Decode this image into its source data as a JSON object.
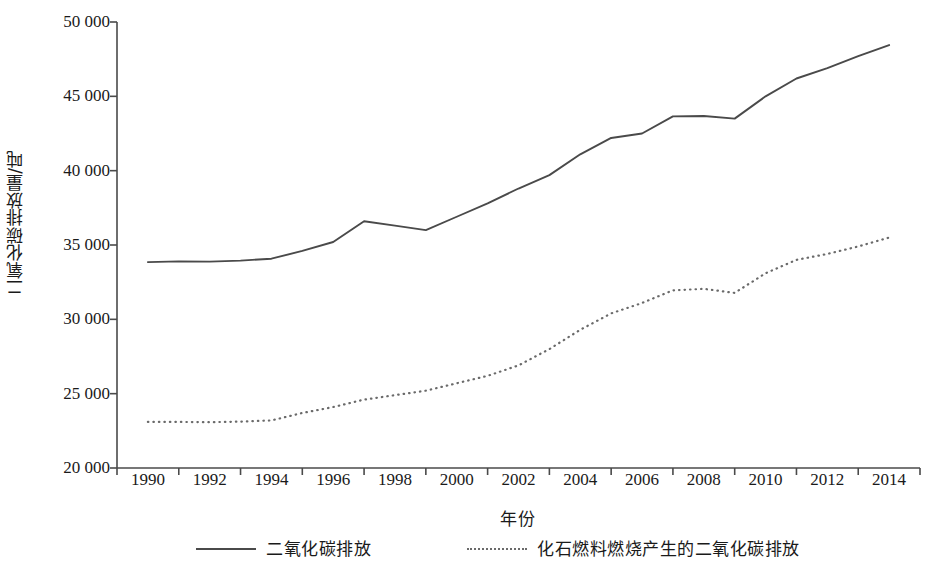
{
  "chart_data": {
    "type": "line",
    "title": "",
    "xlabel": "年份",
    "ylabel": "二氧化碳排放量/吨",
    "xlim": [
      1989,
      2015
    ],
    "ylim": [
      20000,
      50000
    ],
    "ytick_values": [
      50000,
      45000,
      40000,
      35000,
      30000,
      25000,
      20000
    ],
    "ytick_labels": [
      "50 000",
      "45 000",
      "40 000",
      "35 000",
      "30 000",
      "25 000",
      "20 000"
    ],
    "xtick_values": [
      1990,
      1992,
      1994,
      1996,
      1998,
      2000,
      2002,
      2004,
      2006,
      2008,
      2010,
      2012,
      2014
    ],
    "xtick_labels": [
      "1990",
      "1992",
      "1994",
      "1996",
      "1998",
      "2000",
      "2002",
      "2004",
      "2006",
      "2008",
      "2010",
      "2012",
      "2014"
    ],
    "grid": false,
    "legend_position": "bottom",
    "x": [
      1990,
      1991,
      1992,
      1993,
      1994,
      1995,
      1996,
      1997,
      1998,
      1999,
      2000,
      2001,
      2002,
      2003,
      2004,
      2005,
      2006,
      2007,
      2008,
      2009,
      2010,
      2011,
      2012,
      2013,
      2014
    ],
    "series": [
      {
        "name": "二氧化碳排放",
        "style": "solid",
        "color": "#4a4a4a",
        "values": [
          33850,
          33900,
          33880,
          33950,
          34080,
          34600,
          35200,
          36600,
          36300,
          36000,
          36900,
          37800,
          38800,
          39700,
          41100,
          42200,
          42500,
          43650,
          43680,
          43500,
          45000,
          46200,
          46900,
          47700,
          48450
        ]
      },
      {
        "name": "化石燃料燃烧产生的二氧化碳排放",
        "style": "dotted",
        "color": "#6a6a6a",
        "values": [
          23100,
          23100,
          23080,
          23120,
          23200,
          23700,
          24100,
          24600,
          24900,
          25200,
          25700,
          26200,
          26900,
          28000,
          29300,
          30400,
          31100,
          31950,
          32050,
          31780,
          33100,
          34000,
          34400,
          34900,
          35500
        ]
      }
    ]
  },
  "axes": {
    "y_axis_title": "二氧化碳排放量/吨",
    "x_axis_title": "年份"
  },
  "legend": {
    "items": [
      {
        "label": "二氧化碳排放",
        "style": "solid"
      },
      {
        "label": "化石燃料燃烧产生的二氧化碳排放",
        "style": "dotted"
      }
    ]
  }
}
